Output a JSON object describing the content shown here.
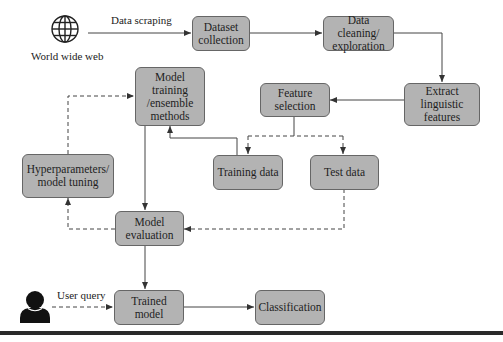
{
  "diagram": {
    "source": {
      "label": "World wide web",
      "icon": "globe-icon"
    },
    "edge_labels": {
      "scraping": "Data scraping",
      "query": "User query"
    },
    "user": {
      "icon": "user-icon"
    },
    "nodes": {
      "dataset_collection": "Dataset\ncollection",
      "data_cleaning": "Data cleaning/\nexploration",
      "extract_features": "Extract linguistic\nfeatures",
      "feature_selection": "Feature\nselection",
      "model_training": "Model training\n/ensemble\nmethods",
      "training_data": "Training data",
      "test_data": "Test data",
      "hyperparameters": "Hyperparameters/\nmodel tuning",
      "model_evaluation": "Model\nevaluation",
      "trained_model": "Trained model",
      "classification": "Classification"
    },
    "colors": {
      "box_fill": "#b3b3b3",
      "box_border": "#666666",
      "line": "#444444",
      "bar": "#2a2a2a"
    }
  }
}
